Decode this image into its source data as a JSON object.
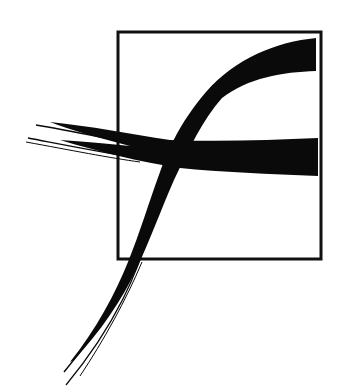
{
  "graphic": {
    "type": "brush-stroke-logo",
    "description": "Calligraphic brush-stroke letter f overlapping a square outline",
    "colors": {
      "background": "#ffffff",
      "ink": "#0a0a0a",
      "frame": "#111111"
    },
    "frame": {
      "x": 117,
      "y": 31,
      "width": 205,
      "height": 229,
      "stroke_width": 3
    }
  }
}
